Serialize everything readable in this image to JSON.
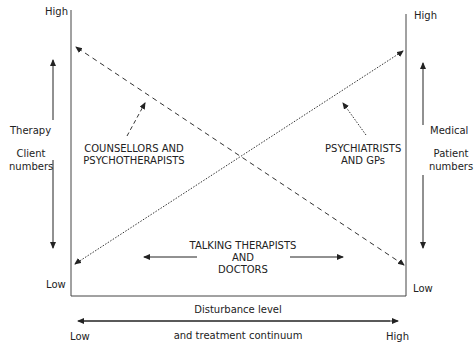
{
  "left_axis": {
    "high": "High",
    "low": "Low",
    "title": "Therapy",
    "subtitle_line1": "Client",
    "subtitle_line2": "numbers"
  },
  "right_axis": {
    "high": "High",
    "low": "Low",
    "title": "Medical",
    "subtitle_line1": "Patient",
    "subtitle_line2": "numbers"
  },
  "bottom_axis": {
    "title": "Disturbance level",
    "subtitle": "and treatment continuum",
    "low": "Low",
    "high": "High"
  },
  "groups": {
    "counsellors": {
      "line1": "COUNSELLORS AND",
      "line2": "PSYCHOTHERAPISTS"
    },
    "psychiatrists": {
      "line1": "PSYCHIATRISTS",
      "line2": "AND GPs"
    },
    "talking": {
      "line1": "TALKING THERAPISTS",
      "line2": "AND",
      "line3": "DOCTORS"
    }
  },
  "lines": [
    {
      "name": "therapy-line",
      "style": "dashed",
      "from": "left-high",
      "to": "right-low"
    },
    {
      "name": "medical-line",
      "style": "dotted",
      "from": "left-low",
      "to": "right-high"
    }
  ]
}
